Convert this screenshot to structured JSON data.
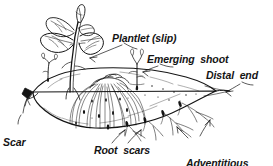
{
  "figure": {
    "kind": "botanical-line-drawing",
    "background_color": "#ffffff",
    "ink_color": "#141414"
  },
  "labels": {
    "plantlet": "Plantlet (slip)",
    "emerging_shoot": "Emerging  shoot",
    "distal_end": "Distal  end",
    "scar_line1": "Scar",
    "scar_line2": "attachment",
    "scar_line3": "to  plant",
    "root_scars": "Root  scars",
    "adventitious_line1": "Adventitious",
    "adventitious_line2": "roots"
  }
}
